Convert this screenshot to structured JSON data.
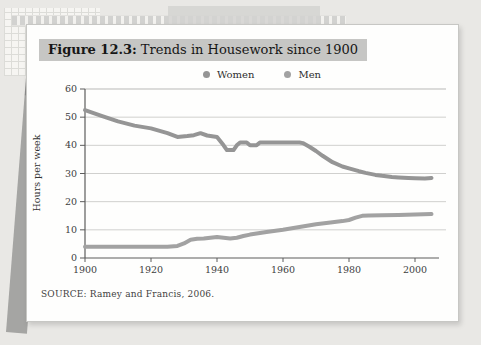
{
  "figure": {
    "label": "Figure 12.3:",
    "title": "Trends in Housework since 1900"
  },
  "page": {
    "source_text": "SOURCE: Ramey and Francis, 2006."
  },
  "chart_data": {
    "type": "line",
    "xlabel": "",
    "ylabel": "Hours per week",
    "xlim": [
      1900,
      2007
    ],
    "ylim": [
      0,
      60
    ],
    "x_ticks": [
      1900,
      1920,
      1940,
      1960,
      1980,
      2000
    ],
    "y_ticks": [
      0,
      10,
      20,
      30,
      40,
      50,
      60
    ],
    "grid": true,
    "legend_position": "top-center",
    "series": [
      {
        "name": "Women",
        "color": "#959595",
        "x": [
          1900,
          1905,
          1910,
          1915,
          1920,
          1925,
          1928,
          1931,
          1933,
          1935,
          1937,
          1940,
          1942,
          1943,
          1945,
          1946,
          1947,
          1949,
          1950,
          1952,
          1953,
          1955,
          1960,
          1965,
          1966,
          1968,
          1970,
          1972,
          1975,
          1978,
          1980,
          1983,
          1985,
          1988,
          1990,
          1993,
          1995,
          1998,
          2000,
          2003,
          2005
        ],
        "values": [
          52.5,
          50.5,
          48.5,
          47,
          46,
          44.3,
          43,
          43.3,
          43.6,
          44.3,
          43.5,
          43,
          40,
          38.3,
          38.3,
          40,
          41,
          41,
          40,
          40,
          41,
          41,
          41,
          41,
          40.8,
          39.5,
          38,
          36.3,
          34,
          32.5,
          31.8,
          30.8,
          30.2,
          29.5,
          29.2,
          28.8,
          28.6,
          28.4,
          28.3,
          28.2,
          28.4
        ]
      },
      {
        "name": "Men",
        "color": "#a2a2a2",
        "x": [
          1900,
          1905,
          1910,
          1915,
          1920,
          1925,
          1928,
          1930,
          1932,
          1934,
          1936,
          1938,
          1940,
          1942,
          1944,
          1946,
          1948,
          1950,
          1955,
          1960,
          1965,
          1970,
          1975,
          1978,
          1980,
          1982,
          1984,
          1986,
          1990,
          1995,
          2000,
          2005
        ],
        "values": [
          4,
          4,
          4,
          4,
          4,
          4,
          4.3,
          5.2,
          6.5,
          6.8,
          6.9,
          7.2,
          7.5,
          7.2,
          6.9,
          7.2,
          7.8,
          8.3,
          9.2,
          10,
          11,
          12,
          12.7,
          13.1,
          13.5,
          14.3,
          15,
          15.1,
          15.2,
          15.3,
          15.4,
          15.6
        ]
      }
    ],
    "source": "SOURCE: Ramey and Francis, 2006."
  }
}
